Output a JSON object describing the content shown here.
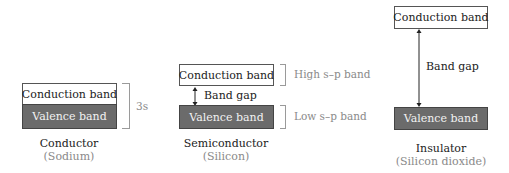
{
  "colors": {
    "valence_fill": "#6b6b6b",
    "conduction_fill": "#ffffff",
    "secondary_text": "#8a8a8a"
  },
  "conductor": {
    "conduction_label": "Conduction band",
    "valence_label": "Valence band",
    "bracket_label": "3s",
    "title": "Conductor",
    "example": "(Sodium)"
  },
  "semiconductor": {
    "conduction_label": "Conduction band",
    "valence_label": "Valence band",
    "gap_label": "Band gap",
    "high_band_label": "High s–p band",
    "low_band_label": "Low s–p band",
    "title": "Semiconductor",
    "example": "(Silicon)"
  },
  "insulator": {
    "conduction_label": "Conduction band",
    "valence_label": "Valence band",
    "gap_label": "Band gap",
    "title": "Insulator",
    "example": "(Silicon dioxide)"
  }
}
